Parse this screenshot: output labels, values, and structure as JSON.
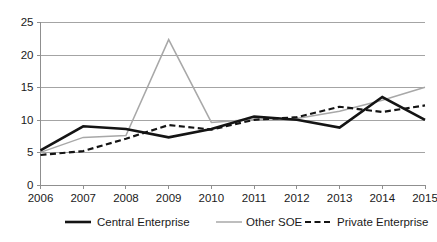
{
  "chart_data": {
    "type": "line",
    "title": "",
    "xlabel": "",
    "ylabel": "",
    "categories": [
      "2006",
      "2007",
      "2008",
      "2009",
      "2010",
      "2011",
      "2012",
      "2013",
      "2014",
      "2015"
    ],
    "x": [
      2006,
      2007,
      2008,
      2009,
      2010,
      2011,
      2012,
      2013,
      2014,
      2015
    ],
    "ylim": [
      0,
      25
    ],
    "yticks": [
      0,
      5,
      10,
      15,
      20,
      25
    ],
    "ytick_labels": [
      "0",
      "5",
      "10",
      "15",
      "20",
      "25"
    ],
    "grid": "horizontal",
    "legend_position": "bottom",
    "series": [
      {
        "name": "Central Enterprise",
        "style": "solid-thick",
        "color": "#141414",
        "values": [
          5.3,
          9.0,
          8.6,
          7.3,
          8.6,
          10.5,
          10.0,
          8.8,
          13.5,
          10.0
        ]
      },
      {
        "name": "Other SOE",
        "style": "solid-thin",
        "color": "#a8a8a8",
        "values": [
          5.0,
          7.3,
          7.6,
          22.3,
          9.6,
          10.1,
          10.2,
          11.3,
          13.0,
          15.0
        ]
      },
      {
        "name": "Private Enterprise",
        "style": "dashed",
        "color": "#141414",
        "values": [
          4.6,
          5.2,
          7.1,
          9.2,
          8.5,
          10.0,
          10.4,
          12.0,
          11.2,
          12.2
        ]
      }
    ]
  },
  "axes": {
    "y_axis_name": "value-axis",
    "x_axis_name": "year-axis"
  },
  "legend": {
    "items": [
      {
        "label": "Central Enterprise",
        "swatch": "solid-thick-black"
      },
      {
        "label": "Other SOE",
        "swatch": "solid-thin-gray"
      },
      {
        "label": "Private Enterprise",
        "swatch": "dashed-black"
      }
    ]
  }
}
